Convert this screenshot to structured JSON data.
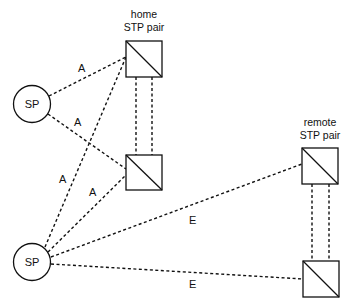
{
  "diagram": {
    "nodes": {
      "sp_top": {
        "label": "SP",
        "type": "signaling-point"
      },
      "sp_bottom": {
        "label": "SP",
        "type": "signaling-point"
      },
      "home_pair": {
        "label_line1": "home",
        "label_line2": "STP pair"
      },
      "remote_pair": {
        "label_line1": "remote",
        "label_line2": "STP pair"
      }
    },
    "links": {
      "a1": "A",
      "a2": "A",
      "a3": "A",
      "a4": "A",
      "e1": "E",
      "e2": "E"
    }
  }
}
